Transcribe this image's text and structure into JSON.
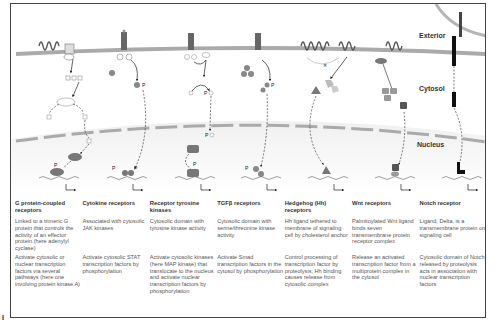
{
  "figure": {
    "region_labels": {
      "exterior": "Exterior",
      "cytosol": "Cytosol",
      "nucleus": "Nucleus"
    },
    "phospho_label": "P",
    "colors": {
      "membrane": "#a9a9a9",
      "nucleus_gradient_top": "#ffffff",
      "nucleus_gradient_bottom": "#e6e6e6",
      "frame": "#444444",
      "text_title": "#333333",
      "text_body": "#555555"
    },
    "corner_mark": "I"
  },
  "pathways": [
    {
      "title": "G protein-coupled receptors",
      "description": "Linked to a trimeric G protein that controls the activity of an effector protein (here adenylyl cyclase)",
      "effect": "Activate cytosolic or nuclear transcription factors via several pathways (here one involving protein kinase A)"
    },
    {
      "title": "Cytokine receptors",
      "description": "Associated with cytosolic JAK kinases",
      "effect": "Activate cytosolic STAT transcription factors by phosphorylation"
    },
    {
      "title": "Receptor tyrosine kinases",
      "description": "Cytosolic domain with tyrosine kinase activity",
      "effect": "Activate cytosolic kinases (here MAP kinase) that translocate to the nucleus and activate nuclear transcription factors by phosphorylation"
    },
    {
      "title": "TGFβ receptors",
      "description": "Cytosolic domain with serine/threonine kinase activity",
      "effect": "Activate Smad transcription factors in the cytosol by phosphorylation"
    },
    {
      "title": "Hedgehog (Hh) receptors",
      "description": "Hh ligand tethered to membrane of signaling cell by cholesterol anchor",
      "effect": "Control processing of transcription factor by proteolysis; Hh binding causes release from cytosolic complex"
    },
    {
      "title": "Wnt receptors",
      "description": "Palmitoylated Wnt ligand binds seven transmembrane protein receptor complex",
      "effect": "Release an activated transcription factor from a multiprotein complex in the cytosol"
    },
    {
      "title": "Notch receptor",
      "description": "Ligand, Delta, is a transmembrane protein on signaling cell",
      "effect": "Cytosolic domain of Notch released by proteolysis acts in association with nuclear transcription factors"
    }
  ]
}
